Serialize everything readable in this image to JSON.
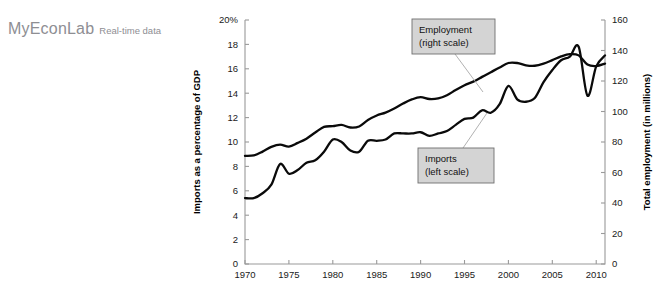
{
  "logo": {
    "main": "MyEconLab",
    "sub": "Real-time data"
  },
  "chart_data": {
    "type": "line",
    "title": "",
    "xlabel": "",
    "ylabel": "Imports as a percentage of GDP",
    "y2label": "Total employment (in millions)",
    "ylim": [
      0,
      20
    ],
    "y2lim": [
      0,
      160
    ],
    "xlim": [
      1970,
      2011
    ],
    "grid": false,
    "legend_position": "annotations",
    "yticks": [
      "0",
      "2",
      "4",
      "6",
      "8",
      "10",
      "12",
      "14",
      "16",
      "18",
      "20%"
    ],
    "ytick_values": [
      0,
      2,
      4,
      6,
      8,
      10,
      12,
      14,
      16,
      18,
      20
    ],
    "y2ticks": [
      "0",
      "20",
      "40",
      "60",
      "80",
      "100",
      "120",
      "140",
      "160"
    ],
    "y2tick_values": [
      0,
      20,
      40,
      60,
      80,
      100,
      120,
      140,
      160
    ],
    "xticks": [
      "1970",
      "1975",
      "1980",
      "1985",
      "1990",
      "1995",
      "2000",
      "2005",
      "2010"
    ],
    "xtick_values": [
      1970,
      1975,
      1980,
      1985,
      1990,
      1995,
      2000,
      2005,
      2010
    ],
    "annotations": [
      {
        "label": "Employment",
        "sublabel": "(right scale)",
        "name": "employment-callout"
      },
      {
        "label": "Imports",
        "sublabel": "(left scale)",
        "name": "imports-callout"
      }
    ],
    "series": [
      {
        "name": "Imports",
        "axis": "left",
        "units": "percent of GDP",
        "x": [
          1970,
          1971,
          1972,
          1973,
          1974,
          1975,
          1976,
          1977,
          1978,
          1979,
          1980,
          1981,
          1982,
          1983,
          1984,
          1985,
          1986,
          1987,
          1988,
          1989,
          1990,
          1991,
          1992,
          1993,
          1994,
          1995,
          1996,
          1997,
          1998,
          1999,
          2000,
          2001,
          2002,
          2003,
          2004,
          2005,
          2006,
          2007,
          2008,
          2009,
          2010,
          2011
        ],
        "values": [
          5.4,
          5.4,
          5.8,
          6.5,
          8.2,
          7.4,
          7.7,
          8.3,
          8.5,
          9.2,
          10.2,
          10.0,
          9.3,
          9.2,
          10.1,
          10.1,
          10.2,
          10.7,
          10.7,
          10.7,
          10.8,
          10.5,
          10.7,
          10.9,
          11.4,
          11.9,
          12.0,
          12.6,
          12.4,
          13.1,
          14.6,
          13.5,
          13.3,
          13.6,
          14.9,
          15.9,
          16.7,
          17.0,
          17.8,
          13.8,
          16.2,
          17.1
        ]
      },
      {
        "name": "Employment",
        "axis": "right",
        "units": "millions",
        "x": [
          1970,
          1971,
          1972,
          1973,
          1974,
          1975,
          1976,
          1977,
          1978,
          1979,
          1980,
          1981,
          1982,
          1983,
          1984,
          1985,
          1986,
          1987,
          1988,
          1989,
          1990,
          1991,
          1992,
          1993,
          1994,
          1995,
          1996,
          1997,
          1998,
          1999,
          2000,
          2001,
          2002,
          2003,
          2004,
          2005,
          2006,
          2007,
          2008,
          2009,
          2010,
          2011
        ],
        "values": [
          70.9,
          71.2,
          73.7,
          76.8,
          78.3,
          77.0,
          79.4,
          82.2,
          86.2,
          89.9,
          90.4,
          91.2,
          89.5,
          90.2,
          94.4,
          97.4,
          99.3,
          102.0,
          105.2,
          107.9,
          109.4,
          108.2,
          108.6,
          110.7,
          114.1,
          117.2,
          119.6,
          122.7,
          125.8,
          128.9,
          131.8,
          131.8,
          130.3,
          130.0,
          131.4,
          133.7,
          136.1,
          137.6,
          136.8,
          130.8,
          129.8,
          131.4
        ]
      }
    ]
  }
}
